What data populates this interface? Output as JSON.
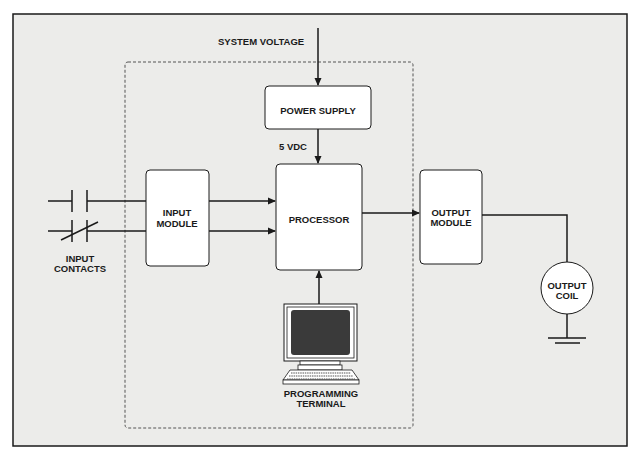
{
  "diagram": {
    "colors": {
      "background": "#ececea",
      "frame": "#1a1a1a",
      "box_fill": "#ffffff",
      "stroke": "#1a1a1a",
      "screen": "#3a3a3a"
    },
    "labels": {
      "system_voltage": "SYSTEM VOLTAGE",
      "power_supply": "POWER SUPPLY",
      "vdc": "5 VDC",
      "processor": "PROCESSOR",
      "input_module_line1": "INPUT",
      "input_module_line2": "MODULE",
      "output_module_line1": "OUTPUT",
      "output_module_line2": "MODULE",
      "input_contacts_line1": "INPUT",
      "input_contacts_line2": "CONTACTS",
      "output_coil_line1": "OUTPUT",
      "output_coil_line2": "COIL",
      "terminal_line1": "PROGRAMMING",
      "terminal_line2": "TERMINAL"
    }
  }
}
